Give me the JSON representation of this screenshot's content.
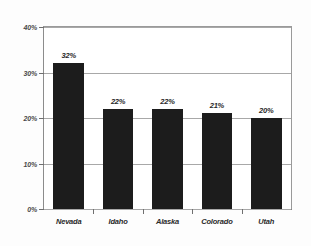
{
  "chart_data": {
    "type": "bar",
    "title": "",
    "subtitle": "",
    "xlabel": "",
    "ylabel": "",
    "categories": [
      "Nevada",
      "Idaho",
      "Alaska",
      "Colorado",
      "Utah"
    ],
    "values": [
      32,
      22,
      22,
      21,
      20
    ],
    "value_labels": [
      "32%",
      "22%",
      "22%",
      "21%",
      "20%"
    ],
    "ylim": [
      0,
      40
    ],
    "ytick_values": [
      0,
      10,
      20,
      30,
      40
    ],
    "ytick_labels": [
      "0%",
      "10%",
      "20%",
      "30%",
      "40%"
    ],
    "grid": true,
    "grid_axis": "y",
    "legend": false,
    "legend_position": "none",
    "bar_color": "#1c1c1c",
    "grid_color": "#a8a8a8",
    "axis_color": "#6f6f6f",
    "background_color": "#ffffff"
  }
}
